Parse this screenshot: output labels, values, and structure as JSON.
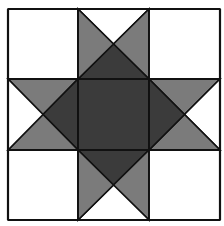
{
  "diagram": {
    "title": "",
    "type": "quilt-block",
    "pattern_name": "",
    "grid": {
      "rows": 3,
      "cols": 3,
      "x_lines": [
        8,
        78,
        149,
        220
      ],
      "y_lines": [
        9,
        79,
        150,
        220
      ]
    },
    "colors": {
      "background": "#ffffff",
      "light": "#ffffff",
      "medium": "#7b7b7b",
      "dark": "#3b3b3b",
      "stroke": "#111111"
    },
    "cells": [
      {
        "row": 0,
        "col": 0,
        "kind": "solid",
        "fill": "light"
      },
      {
        "row": 0,
        "col": 1,
        "kind": "quarter-square",
        "top": "light",
        "right": "medium",
        "bottom": "dark",
        "left": "medium"
      },
      {
        "row": 0,
        "col": 2,
        "kind": "solid",
        "fill": "light"
      },
      {
        "row": 1,
        "col": 0,
        "kind": "quarter-square",
        "top": "medium",
        "right": "dark",
        "bottom": "medium",
        "left": "light"
      },
      {
        "row": 1,
        "col": 1,
        "kind": "solid",
        "fill": "dark"
      },
      {
        "row": 1,
        "col": 2,
        "kind": "quarter-square",
        "top": "medium",
        "right": "light",
        "bottom": "medium",
        "left": "dark"
      },
      {
        "row": 2,
        "col": 0,
        "kind": "solid",
        "fill": "light"
      },
      {
        "row": 2,
        "col": 1,
        "kind": "quarter-square",
        "top": "dark",
        "right": "medium",
        "bottom": "light",
        "left": "medium"
      },
      {
        "row": 2,
        "col": 2,
        "kind": "solid",
        "fill": "light"
      }
    ],
    "center_diamond": {
      "fill": "dark",
      "points": [
        [
          113.5,
          44
        ],
        [
          184,
          114.5
        ],
        [
          113.5,
          185
        ],
        [
          43,
          114.5
        ]
      ]
    }
  }
}
